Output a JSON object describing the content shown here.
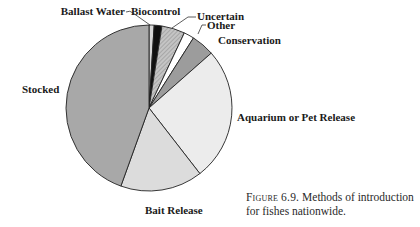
{
  "chart_data": {
    "type": "pie",
    "title": "",
    "start_angle_deg": 0,
    "direction": "clockwise",
    "categories": [
      "Ballast Water",
      "Biocontrol",
      "Uncertain",
      "Other",
      "Conservation",
      "Aquarium or Pet Release",
      "Bait Release",
      "Stocked"
    ],
    "values": [
      1,
      1.5,
      4.5,
      2,
      4.5,
      26,
      16,
      44.5
    ],
    "unit": "percent (estimated from slice angles)",
    "colors": [
      "#d8d8d8",
      "#111111",
      "#b8b8b8",
      "#ffffff",
      "#9c9c9c",
      "#ececec",
      "#dcdcdc",
      "#a8a8a8"
    ],
    "patterns": [
      "none",
      "none",
      "hatched",
      "none",
      "none",
      "none",
      "none",
      "none"
    ],
    "legend": "none (direct labels)",
    "labels": [
      {
        "text": "Ballast Water",
        "x": 125,
        "y": 15,
        "anchor": "end",
        "leader": true
      },
      {
        "text": "Biocontrol",
        "x": 131,
        "y": 15,
        "anchor": "start",
        "leader": true
      },
      {
        "text": "Uncertain",
        "x": 197,
        "y": 20,
        "anchor": "start",
        "leader": true
      },
      {
        "text": "Other",
        "x": 207,
        "y": 29,
        "anchor": "start",
        "leader": true
      },
      {
        "text": "Conservation",
        "x": 218,
        "y": 44,
        "anchor": "start",
        "leader": false
      },
      {
        "text": "Aquarium or Pet Release",
        "x": 237,
        "y": 121,
        "anchor": "start",
        "leader": false
      },
      {
        "text": "Bait Release",
        "x": 145,
        "y": 214,
        "anchor": "start",
        "leader": false
      },
      {
        "text": "Stocked",
        "x": 22,
        "y": 93,
        "anchor": "start",
        "leader": false
      }
    ]
  },
  "caption": {
    "figure_number": "Figure 6.9.",
    "text": " Methods of introduction for fishes nationwide."
  }
}
